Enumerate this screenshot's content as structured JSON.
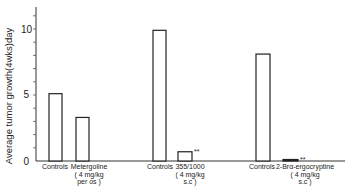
{
  "chart_data": {
    "type": "bar",
    "title": "",
    "xlabel": "",
    "ylabel": "Average tumor growth(4wks)day",
    "ylim": [
      0,
      11.5
    ],
    "yticks": [
      0,
      5,
      10
    ],
    "minor_ticks_every": 1,
    "grid": false,
    "legend": null,
    "groups": [
      {
        "bars": [
          {
            "label": "Controls",
            "value": 5.1
          },
          {
            "label": "Metergoline",
            "sublabel_1": "( 4 mg/kg",
            "sublabel_2": "per os )",
            "value": 3.3
          }
        ]
      },
      {
        "bars": [
          {
            "label": "Controls",
            "value": 9.9
          },
          {
            "label": "355/1000",
            "sublabel_1": "( 4  mg/kg",
            "sublabel_2": "s.c )",
            "value": 0.7,
            "annotation": "**"
          }
        ]
      },
      {
        "bars": [
          {
            "label": "Controls",
            "value": 8.1
          },
          {
            "label": "2-Brα-ergocryptine",
            "sublabel_1": "( 4 mg/kg",
            "sublabel_2": "s.c )",
            "value": 0.1,
            "annotation": "**"
          }
        ]
      }
    ],
    "categories": [
      "Controls",
      "Metergoline",
      "Controls",
      "355/1000",
      "Controls",
      "2-Brα-ergocryptine"
    ],
    "values": [
      5.1,
      3.3,
      9.9,
      0.7,
      8.1,
      0.1
    ]
  },
  "axis": {
    "y_tick_labels": [
      "0",
      "5",
      "10"
    ]
  }
}
